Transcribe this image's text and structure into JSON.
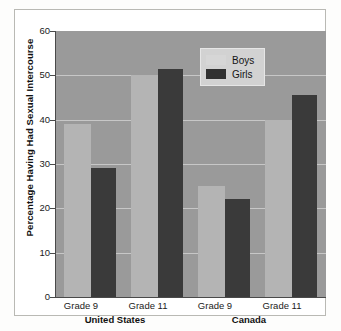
{
  "chart_data": {
    "type": "bar",
    "title": "",
    "xlabel": "",
    "ylabel": "Percentage Having Had Sexual Intercourse",
    "ylim": [
      0,
      60
    ],
    "ytick_labels": [
      "0",
      "10",
      "20",
      "30",
      "40",
      "50",
      "60"
    ],
    "yticks": [
      0,
      10,
      20,
      30,
      40,
      50,
      60
    ],
    "grid": true,
    "legend_position": "top-right",
    "categories": [
      "Grade 9",
      "Grade 11",
      "Grade 9",
      "Grade 11"
    ],
    "groups": [
      {
        "label": "United States",
        "categories": [
          "Grade 9",
          "Grade 11"
        ]
      },
      {
        "label": "Canada",
        "categories": [
          "Grade 9",
          "Grade 11"
        ]
      }
    ],
    "series": [
      {
        "name": "Boys",
        "color": "#b4b4b4",
        "values": [
          39,
          50,
          25,
          40
        ]
      },
      {
        "name": "Girls",
        "color": "#3a3a3a",
        "values": [
          29,
          51.5,
          22,
          45.5
        ]
      }
    ],
    "plot_background": "#9a9a9a",
    "legend": [
      "Boys",
      "Girls"
    ]
  },
  "legend": {
    "boys_label": "Boys",
    "girls_label": "Girls"
  },
  "axis": {
    "y_title": "Percentage Having Had Sexual Intercourse",
    "y_ticks": [
      "60",
      "50",
      "40",
      "30",
      "20",
      "10",
      "0"
    ]
  },
  "x_axis": {
    "categories": [
      "Grade 9",
      "Grade 11",
      "Grade 9",
      "Grade 11"
    ],
    "group_labels": [
      "United States",
      "Canada"
    ]
  }
}
